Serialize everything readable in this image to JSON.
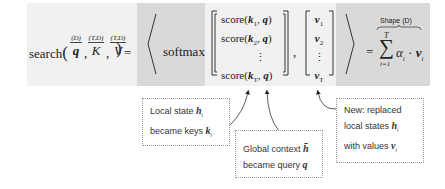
{
  "equation": {
    "lhs": {
      "func": "search",
      "args": [
        {
          "symbol": "q",
          "shape": "(D)",
          "style": "bold-italic"
        },
        {
          "symbol": "K",
          "shape": "(T,D)",
          "style": "italic"
        },
        {
          "symbol": "V",
          "shape": "(T,D)",
          "style": "italic"
        }
      ],
      "comma": ",",
      "equals": "="
    },
    "softmax_label": "softmax",
    "scores": [
      {
        "text": "score(",
        "k": "k",
        "sub": "1",
        "q": "q",
        "close": ")"
      },
      {
        "text": "score(",
        "k": "k",
        "sub": "2",
        "q": "q",
        "close": ")"
      },
      {
        "text": "⋮"
      },
      {
        "text": "score(",
        "k": "k",
        "sub": "T",
        "q": "q",
        "close": ")"
      }
    ],
    "values": [
      {
        "v": "v",
        "sub": "1"
      },
      {
        "v": "v",
        "sub": "2"
      },
      {
        "v": "⋮",
        "sub": ""
      },
      {
        "v": "v",
        "sub": "T"
      }
    ],
    "separator": ",",
    "rhs": {
      "shape_label": "Shape (D)",
      "equals": "=",
      "sum_symbol": "∑",
      "upper": "T",
      "lower": "i=1",
      "alpha": "α",
      "alpha_sub": "i",
      "dot": "·",
      "v": "v",
      "v_sub": "i"
    }
  },
  "annotations": [
    {
      "id": "keys",
      "line1": "Local state ",
      "sym1": "h",
      "sub1": "i",
      "line2": "became keys ",
      "sym2": "k",
      "sub2": "i"
    },
    {
      "id": "query",
      "line1": "Global context ",
      "sym1": "h̄",
      "line2": "became query ",
      "sym2": "q"
    },
    {
      "id": "values",
      "line1": "New: replaced",
      "line2": "local states ",
      "sym2": "h",
      "sub2": "i",
      "line3": "with values ",
      "sym3": "v",
      "sub3": "i"
    }
  ],
  "colors": {
    "light_band": "#f1f1f1",
    "dark_band": "#d9d9d9",
    "arrow": "#333333",
    "note_border": "#9a9a9a"
  }
}
